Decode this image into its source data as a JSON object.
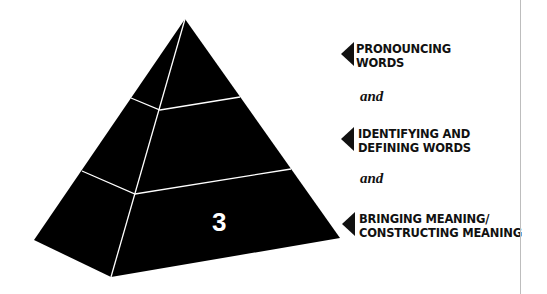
{
  "diagram": {
    "type": "pyramid",
    "colors": {
      "fill": "#000000",
      "lines": "#ffffff",
      "text": "#111111",
      "divider": "#bdbdbd"
    },
    "front_label": "3",
    "levels": [
      {
        "label_line1": "PRONOUNCING",
        "label_line2": "WORDS"
      },
      {
        "label_line1": "IDENTIFYING AND",
        "label_line2": "DEFINING WORDS"
      },
      {
        "label_line1": "BRINGING MEANING/",
        "label_line2": "CONSTRUCTING MEANING"
      }
    ],
    "connectors": [
      "and",
      "and"
    ]
  }
}
